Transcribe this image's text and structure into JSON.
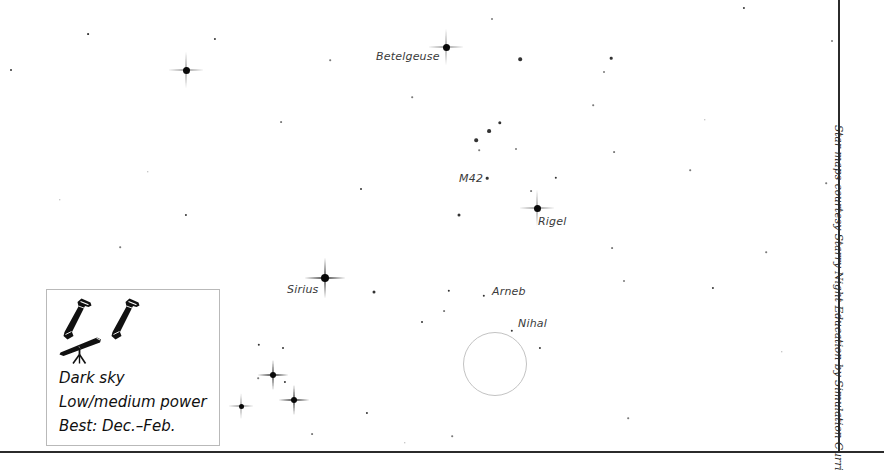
{
  "chart_data": {
    "type": "scatter",
    "xlabel": "",
    "ylabel": "",
    "xlim": [
      0,
      838
    ],
    "ylim": [
      0,
      452
    ],
    "grid": false,
    "legend_position": "bottom-left",
    "named_objects": [
      {
        "name": "Betelgeuse",
        "x": 446,
        "y": 47,
        "magnitude_class": "bright",
        "label_x": 376,
        "label_y": 50
      },
      {
        "name": "M42",
        "x": 487,
        "y": 178,
        "magnitude_class": "faint",
        "label_x": 459,
        "label_y": 172
      },
      {
        "name": "Rigel",
        "x": 537,
        "y": 208,
        "magnitude_class": "bright",
        "label_x": 538,
        "label_y": 215
      },
      {
        "name": "Sirius",
        "x": 325,
        "y": 278,
        "magnitude_class": "bright",
        "label_x": 287,
        "label_y": 283
      },
      {
        "name": "Arneb",
        "x": 484,
        "y": 296,
        "magnitude_class": "mid",
        "label_x": 492,
        "label_y": 285
      },
      {
        "name": "Nihal",
        "x": 512,
        "y": 331,
        "magnitude_class": "mid",
        "label_x": 518,
        "label_y": 317
      }
    ],
    "bright_stars": [
      {
        "x": 446,
        "y": 47,
        "size": 7
      },
      {
        "x": 537,
        "y": 208,
        "size": 7
      },
      {
        "x": 325,
        "y": 278,
        "size": 8
      },
      {
        "x": 186,
        "y": 70,
        "size": 7
      },
      {
        "x": 273,
        "y": 375,
        "size": 6
      },
      {
        "x": 294,
        "y": 400,
        "size": 6
      },
      {
        "x": 241,
        "y": 406,
        "size": 5
      }
    ],
    "stars": [
      {
        "x": 11,
        "y": 70,
        "size": 2.0,
        "class": "mid"
      },
      {
        "x": 88,
        "y": 34,
        "size": 1.8,
        "class": "mid"
      },
      {
        "x": 215,
        "y": 39,
        "size": 2.2,
        "class": "mid"
      },
      {
        "x": 281,
        "y": 122,
        "size": 1.8,
        "class": "faint"
      },
      {
        "x": 361,
        "y": 189,
        "size": 2.0,
        "class": "mid"
      },
      {
        "x": 186,
        "y": 215,
        "size": 2.2,
        "class": "mid"
      },
      {
        "x": 199,
        "y": 310,
        "size": 1.6,
        "class": "faint"
      },
      {
        "x": 120,
        "y": 247,
        "size": 1.6,
        "class": "faint"
      },
      {
        "x": 259,
        "y": 345,
        "size": 2.4,
        "class": "mid"
      },
      {
        "x": 283,
        "y": 348,
        "size": 2.0,
        "class": "mid"
      },
      {
        "x": 285,
        "y": 382,
        "size": 2.2,
        "class": "mid"
      },
      {
        "x": 258,
        "y": 378,
        "size": 1.6,
        "class": "faint"
      },
      {
        "x": 312,
        "y": 434,
        "size": 1.8,
        "class": "faint"
      },
      {
        "x": 367,
        "y": 413,
        "size": 2.2,
        "class": "mid"
      },
      {
        "x": 374,
        "y": 292,
        "size": 3.0,
        "class": "mid"
      },
      {
        "x": 422,
        "y": 322,
        "size": 2.0,
        "class": "mid"
      },
      {
        "x": 444,
        "y": 311,
        "size": 1.8,
        "class": "faint"
      },
      {
        "x": 459,
        "y": 215,
        "size": 3.0,
        "class": "mid"
      },
      {
        "x": 449,
        "y": 291,
        "size": 2.4,
        "class": "mid"
      },
      {
        "x": 476,
        "y": 140,
        "size": 3.6,
        "class": "mid"
      },
      {
        "x": 489,
        "y": 131,
        "size": 3.8,
        "class": "mid"
      },
      {
        "x": 500,
        "y": 123,
        "size": 3.4,
        "class": "mid"
      },
      {
        "x": 479,
        "y": 150,
        "size": 1.6,
        "class": "faint"
      },
      {
        "x": 516,
        "y": 149,
        "size": 2.0,
        "class": "faint"
      },
      {
        "x": 487,
        "y": 178,
        "size": 2.6,
        "class": "mid"
      },
      {
        "x": 531,
        "y": 191,
        "size": 1.8,
        "class": "faint"
      },
      {
        "x": 556,
        "y": 178,
        "size": 2.4,
        "class": "mid"
      },
      {
        "x": 520,
        "y": 59,
        "size": 3.6,
        "class": "mid"
      },
      {
        "x": 492,
        "y": 19,
        "size": 2.0,
        "class": "faint"
      },
      {
        "x": 540,
        "y": 348,
        "size": 2.2,
        "class": "mid"
      },
      {
        "x": 484,
        "y": 296,
        "size": 2.4,
        "class": "mid"
      },
      {
        "x": 512,
        "y": 331,
        "size": 2.4,
        "class": "mid"
      },
      {
        "x": 611,
        "y": 58,
        "size": 2.6,
        "class": "mid"
      },
      {
        "x": 604,
        "y": 72,
        "size": 2.0,
        "class": "faint"
      },
      {
        "x": 593,
        "y": 105,
        "size": 1.6,
        "class": "faint"
      },
      {
        "x": 614,
        "y": 152,
        "size": 1.8,
        "class": "faint"
      },
      {
        "x": 612,
        "y": 248,
        "size": 1.8,
        "class": "faint"
      },
      {
        "x": 624,
        "y": 281,
        "size": 2.0,
        "class": "faint"
      },
      {
        "x": 628,
        "y": 418,
        "size": 1.6,
        "class": "faint"
      },
      {
        "x": 713,
        "y": 288,
        "size": 2.2,
        "class": "mid"
      },
      {
        "x": 744,
        "y": 8,
        "size": 2.2,
        "class": "mid"
      },
      {
        "x": 766,
        "y": 252,
        "size": 1.6,
        "class": "faint"
      },
      {
        "x": 832,
        "y": 41,
        "size": 2.0,
        "class": "faint"
      },
      {
        "x": 826,
        "y": 183,
        "size": 1.6,
        "class": "faint"
      },
      {
        "x": 690,
        "y": 170,
        "size": 1.6,
        "class": "faint"
      },
      {
        "x": 412,
        "y": 97,
        "size": 1.6,
        "class": "faint"
      },
      {
        "x": 330,
        "y": 60,
        "size": 1.6,
        "class": "faint"
      },
      {
        "x": 148,
        "y": 172,
        "size": 1.4,
        "class": "faint"
      },
      {
        "x": 60,
        "y": 200,
        "size": 1.4,
        "class": "faint"
      },
      {
        "x": 705,
        "y": 120,
        "size": 1.4,
        "class": "faint"
      },
      {
        "x": 782,
        "y": 352,
        "size": 1.4,
        "class": "faint"
      },
      {
        "x": 405,
        "y": 443,
        "size": 1.4,
        "class": "faint"
      },
      {
        "x": 452,
        "y": 436,
        "size": 1.6,
        "class": "faint"
      }
    ],
    "fov_circle": {
      "cx": 494,
      "cy": 363,
      "r": 31,
      "stroke": "#c3c3c3"
    }
  },
  "map": {
    "labels": [
      {
        "text": "Betelgeuse",
        "x": 376,
        "y": 50
      },
      {
        "text": "M42",
        "x": 459,
        "y": 172
      },
      {
        "text": "Rigel",
        "x": 538,
        "y": 215
      },
      {
        "text": "Sirius",
        "x": 287,
        "y": 283
      },
      {
        "text": "Arneb",
        "x": 492,
        "y": 285
      },
      {
        "text": "Nihal",
        "x": 518,
        "y": 317
      }
    ]
  },
  "legend": {
    "icons": [
      {
        "name": "binoculars-icon"
      },
      {
        "name": "binoculars-icon"
      },
      {
        "name": "telescope-icon"
      }
    ],
    "lines": [
      "Dark sky",
      "Low/medium power",
      "Best: Dec.–Feb."
    ]
  },
  "credit": {
    "text": "Star maps courtesy Starry Night Education by Simulation Curriculum"
  },
  "colors": {
    "background": "#ffffff",
    "star": "#111111",
    "star_faint": "#7a7a7a",
    "label": "#3a3a3a",
    "border": "#2b2b2b",
    "legend_border": "#b9b9b9",
    "fov_circle": "#c3c3c3"
  }
}
